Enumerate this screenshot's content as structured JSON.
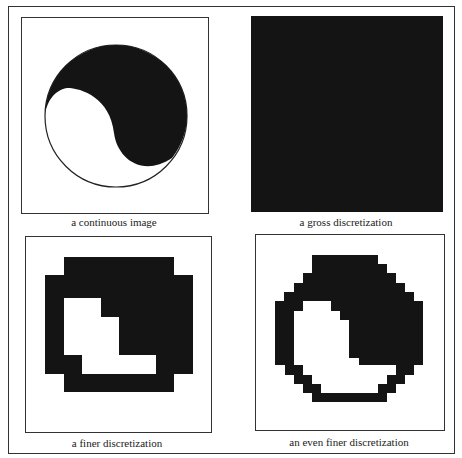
{
  "panels": [
    {
      "caption": "a continuous image"
    },
    {
      "caption": "a gross discretization"
    },
    {
      "caption": "a finer discretization",
      "grid": [
        "00111111",
        "01111111",
        "01111111",
        "00000111",
        "01000111",
        "01000001",
        "01000011",
        "00111110"
      ]
    },
    {
      "caption": "an even finer discretization"
    }
  ],
  "colors": {
    "ink": "#141414"
  }
}
